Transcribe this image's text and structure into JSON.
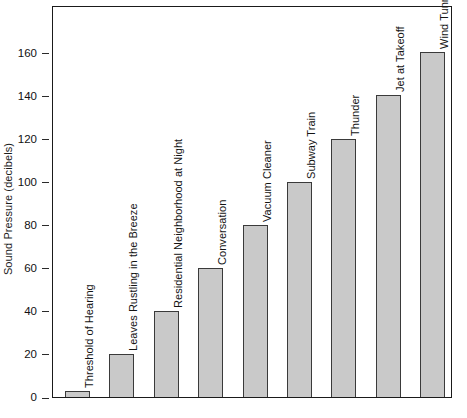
{
  "chart_data": {
    "type": "bar",
    "title": "",
    "subtitle": "",
    "xlabel": "",
    "ylabel": "Sound Pressure (decibels)",
    "categories": [
      "Threshold of Hearing",
      "Leaves Rustling in the Breeze",
      "Residential Neighborhood at Night",
      "Conversation",
      "Vacuum Cleaner",
      "Subway Train",
      "Thunder",
      "Jet at Takeoff",
      "Wind Tunnel"
    ],
    "values": [
      0,
      20,
      40,
      60,
      80,
      100,
      120,
      140,
      160
    ],
    "ylim": [
      0,
      182
    ],
    "yticks": [
      0,
      20,
      40,
      60,
      80,
      100,
      120,
      140,
      160
    ],
    "ytick_labels": [
      "0",
      "20",
      "40",
      "60",
      "80",
      "100",
      "120",
      "140",
      "160"
    ],
    "grid": false,
    "legend": false,
    "legend_position": "none",
    "bar_fill_color": "#c9c9c9",
    "bar_border_color": "#3a3a3a",
    "axis_color": "#1a1a1a",
    "background_color": "#ffffff",
    "label_orientation": "vertical",
    "annotations": []
  }
}
